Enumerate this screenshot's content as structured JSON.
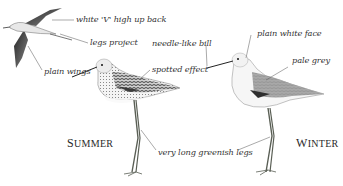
{
  "figure": {
    "birds": [
      {
        "id": "flight",
        "pose": "in flight"
      },
      {
        "id": "summer",
        "pose": "standing",
        "season_label": "SUMMER"
      },
      {
        "id": "winter",
        "pose": "standing",
        "season_label": "WINTER"
      }
    ],
    "annotations": [
      {
        "id": "white-v",
        "text": "white 'V' high up back"
      },
      {
        "id": "legs-project",
        "text": "legs project"
      },
      {
        "id": "plain-wings",
        "text": "plain wings"
      },
      {
        "id": "needle-bill",
        "text": "needle-like bill"
      },
      {
        "id": "spotted-effect",
        "text": "spotted effect"
      },
      {
        "id": "plain-white-face",
        "text": "plain white face"
      },
      {
        "id": "pale-grey",
        "text": "pale grey"
      },
      {
        "id": "long-greenish-legs",
        "text": "very long greenish legs"
      }
    ],
    "seasons": {
      "summer": {
        "first": "S",
        "rest": "UMMER"
      },
      "winter": {
        "first": "W",
        "rest": "INTER"
      }
    },
    "colors": {
      "background": "#ffffff",
      "ink": "#333333",
      "dark_plumage": "#3a3a3a",
      "grey_plumage": "#9a9a9a",
      "legs": "#5a5f55"
    }
  }
}
